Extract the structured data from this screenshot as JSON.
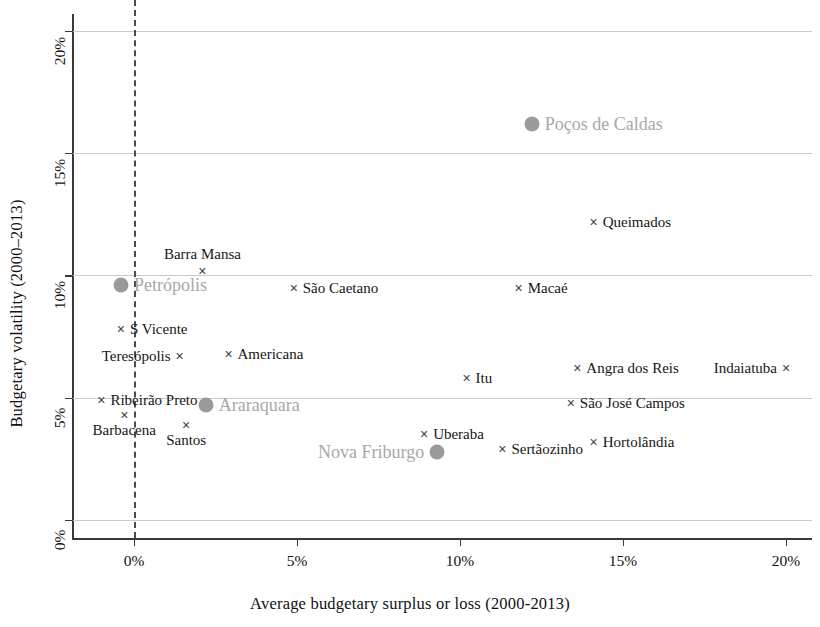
{
  "chart_data": {
    "type": "scatter",
    "title": "",
    "xlabel": "Average budgetary surplus or loss (2000-2013)",
    "ylabel": "Budgetary volatility (2000–2013)",
    "xlim": [
      -1.0,
      20.7
    ],
    "ylim": [
      -0.8,
      20.9
    ],
    "xticks": [
      "0%",
      "5%",
      "10%",
      "15%",
      "20%"
    ],
    "xtick_values": [
      0,
      5,
      10,
      15,
      20
    ],
    "yticks": [
      "0%",
      "5%",
      "10%",
      "15%",
      "20%"
    ],
    "ytick_values": [
      0,
      5,
      10,
      15,
      20
    ],
    "grid": "horizontal",
    "legend": "none",
    "reference_line": {
      "axis": "x",
      "value": 0,
      "style": "dashed"
    },
    "points": [
      {
        "name": "Poços de Caldas",
        "x": 12.2,
        "y": 16.2,
        "marker": "circle",
        "highlight": true,
        "label_pos": "right"
      },
      {
        "name": "Queimados",
        "x": 14.1,
        "y": 12.2,
        "marker": "cross",
        "highlight": false,
        "label_pos": "right"
      },
      {
        "name": "Barra Mansa",
        "x": 2.1,
        "y": 10.2,
        "marker": "cross",
        "highlight": false,
        "label_pos": "above"
      },
      {
        "name": "Petrópolis",
        "x": -0.4,
        "y": 9.6,
        "marker": "circle",
        "highlight": true,
        "label_pos": "right"
      },
      {
        "name": "São Caetano",
        "x": 4.9,
        "y": 9.5,
        "marker": "cross",
        "highlight": false,
        "label_pos": "right"
      },
      {
        "name": "Macaé",
        "x": 11.8,
        "y": 9.5,
        "marker": "cross",
        "highlight": false,
        "label_pos": "right"
      },
      {
        "name": "S Vicente",
        "x": -0.4,
        "y": 7.8,
        "marker": "cross",
        "highlight": false,
        "label_pos": "right"
      },
      {
        "name": "Teresópolis",
        "x": 1.4,
        "y": 6.7,
        "marker": "cross",
        "highlight": false,
        "label_pos": "left"
      },
      {
        "name": "Americana",
        "x": 2.9,
        "y": 6.8,
        "marker": "cross",
        "highlight": false,
        "label_pos": "right"
      },
      {
        "name": "Angra dos Reis",
        "x": 13.6,
        "y": 6.2,
        "marker": "cross",
        "highlight": false,
        "label_pos": "right"
      },
      {
        "name": "Indaiatuba",
        "x": 20.0,
        "y": 6.2,
        "marker": "cross",
        "highlight": false,
        "label_pos": "left"
      },
      {
        "name": "Itu",
        "x": 10.2,
        "y": 5.8,
        "marker": "cross",
        "highlight": false,
        "label_pos": "right"
      },
      {
        "name": "Ribeirão Preto",
        "x": -1.0,
        "y": 4.9,
        "marker": "cross",
        "highlight": false,
        "label_pos": "right"
      },
      {
        "name": "Araraquara",
        "x": 2.2,
        "y": 4.7,
        "marker": "circle",
        "highlight": true,
        "label_pos": "right"
      },
      {
        "name": "São José Campos",
        "x": 13.4,
        "y": 4.8,
        "marker": "cross",
        "highlight": false,
        "label_pos": "right"
      },
      {
        "name": "Barbacena",
        "x": -0.3,
        "y": 4.3,
        "marker": "cross",
        "highlight": false,
        "label_pos": "below"
      },
      {
        "name": "Santos",
        "x": 1.6,
        "y": 3.9,
        "marker": "cross",
        "highlight": false,
        "label_pos": "below"
      },
      {
        "name": "Uberaba",
        "x": 8.9,
        "y": 3.5,
        "marker": "cross",
        "highlight": false,
        "label_pos": "right"
      },
      {
        "name": "Hortolândia",
        "x": 14.1,
        "y": 3.2,
        "marker": "cross",
        "highlight": false,
        "label_pos": "right"
      },
      {
        "name": "Sertãozinho",
        "x": 11.3,
        "y": 2.9,
        "marker": "cross",
        "highlight": false,
        "label_pos": "right"
      },
      {
        "name": "Nova Friburgo",
        "x": 9.3,
        "y": 2.8,
        "marker": "circle",
        "highlight": true,
        "label_pos": "left"
      }
    ],
    "colors": {
      "axis": "#3a3a3a",
      "grid": "#c9c9c9",
      "marker": "#404040",
      "highlight_marker": "#9a9a9a",
      "highlight_label": "#a8a8a8",
      "label": "#161616",
      "reference_line": "#4b4b4b"
    }
  }
}
